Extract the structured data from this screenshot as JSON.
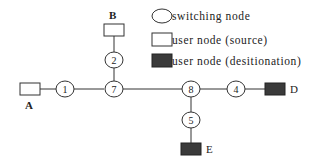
{
  "diagram": {
    "type": "network-topology",
    "colors": {
      "line": "#333333",
      "switching_node_fill": "#ffffff",
      "source_node_fill": "#ffffff",
      "destination_node_fill": "#3a3a3a"
    },
    "legend": {
      "items": [
        {
          "shape": "ellipse",
          "label": "switching node"
        },
        {
          "shape": "white-rectangle",
          "label": "user node (source)"
        },
        {
          "shape": "dark-rectangle",
          "label": "user node (desitionation)"
        }
      ]
    },
    "switching_nodes": [
      {
        "id": "1",
        "label": "1"
      },
      {
        "id": "2",
        "label": "2"
      },
      {
        "id": "4",
        "label": "4"
      },
      {
        "id": "5",
        "label": "5"
      },
      {
        "id": "7",
        "label": "7"
      },
      {
        "id": "8",
        "label": "8"
      }
    ],
    "user_nodes": [
      {
        "id": "A",
        "label": "A",
        "role": "source"
      },
      {
        "id": "B",
        "label": "B",
        "role": "source"
      },
      {
        "id": "D",
        "label": "D",
        "role": "destination"
      },
      {
        "id": "E",
        "label": "E",
        "role": "destination"
      }
    ],
    "edges": [
      [
        "A",
        "1"
      ],
      [
        "1",
        "7"
      ],
      [
        "B",
        "2"
      ],
      [
        "2",
        "7"
      ],
      [
        "7",
        "8"
      ],
      [
        "8",
        "4"
      ],
      [
        "4",
        "D"
      ],
      [
        "8",
        "5"
      ],
      [
        "5",
        "E"
      ]
    ]
  }
}
